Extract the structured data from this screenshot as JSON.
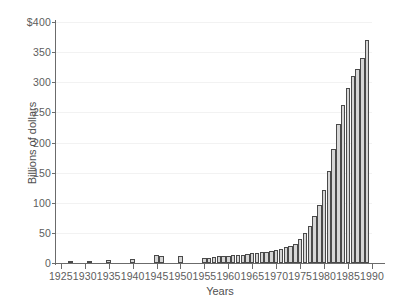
{
  "chart_data": {
    "type": "bar",
    "title": "",
    "subtitle": "",
    "xlabel": "Years",
    "ylabel": "Billions of dollars",
    "grid": true,
    "legend": null,
    "xlim": [
      1924,
      1990
    ],
    "ylim": [
      0,
      400
    ],
    "y_ticks": [
      0,
      50,
      100,
      150,
      200,
      250,
      300,
      350,
      400
    ],
    "y_tick_labels": [
      "0",
      "50",
      "100",
      "150",
      "200",
      "250",
      "300",
      "350",
      "$400"
    ],
    "x_ticks": [
      1925,
      1930,
      1935,
      1940,
      1945,
      1950,
      1955,
      1960,
      1965,
      1970,
      1975,
      1980,
      1985,
      1990
    ],
    "x_tick_labels": [
      "1925",
      "1930",
      "1935",
      "1940",
      "1945",
      "1950",
      "1955",
      "1960",
      "1965",
      "1970",
      "1975",
      "1980",
      "1985",
      "1990"
    ],
    "bar_fill_color": "#d6d6d6",
    "bar_edge_color": "#4a4a4a",
    "axis_color": "#6b6b6b",
    "grid_color": "#f2f2f2",
    "categories": [
      1927,
      1931,
      1935,
      1940,
      1945,
      1946,
      1950,
      1955,
      1956,
      1957,
      1958,
      1959,
      1960,
      1961,
      1962,
      1963,
      1964,
      1965,
      1966,
      1967,
      1968,
      1969,
      1970,
      1971,
      1972,
      1973,
      1974,
      1975,
      1976,
      1977,
      1978,
      1979,
      1980,
      1981,
      1982,
      1983,
      1984,
      1985,
      1986,
      1987,
      1988,
      1989
    ],
    "values": [
      3,
      4,
      5,
      6,
      13,
      12,
      12,
      8,
      9,
      10,
      11,
      11,
      12,
      13,
      14,
      14,
      15,
      16,
      17,
      18,
      19,
      20,
      22,
      24,
      26,
      29,
      32,
      40,
      50,
      62,
      78,
      96,
      122,
      152,
      190,
      230,
      262,
      290,
      310,
      322,
      340,
      370
    ]
  }
}
